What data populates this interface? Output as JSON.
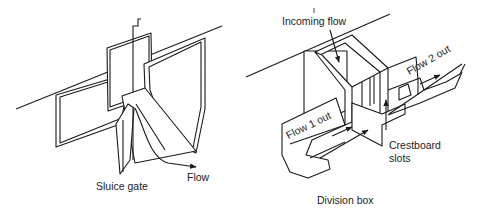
{
  "figures": [
    {
      "id": "sluice-gate",
      "caption": "Sluice gate",
      "labels": {
        "flow": "Flow"
      }
    },
    {
      "id": "division-box",
      "caption": "Division box",
      "labels": {
        "incoming": "Incoming flow",
        "flow1": "Flow 1 out",
        "flow2": "Flow 2 out",
        "crestboard": "Crestboard",
        "slots": "slots"
      }
    }
  ],
  "colors": {
    "line": "#1a1a1a",
    "background": "#ffffff"
  }
}
